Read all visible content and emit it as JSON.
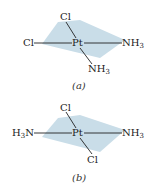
{
  "figures": [
    {
      "id": "a",
      "caption": "(a)",
      "center": "Pt",
      "ligands": {
        "top": "Cl",
        "left": "Cl",
        "right": "NH3",
        "bottom": "NH3"
      },
      "isomer": "cis"
    },
    {
      "id": "b",
      "caption": "(b)",
      "center": "Pt",
      "ligands": {
        "top": "Cl",
        "left": "H3N",
        "right": "NH3",
        "bottom": "Cl"
      },
      "isomer": "trans"
    }
  ],
  "colors": {
    "plane": "#c5dbe6",
    "bond": "#222222"
  }
}
